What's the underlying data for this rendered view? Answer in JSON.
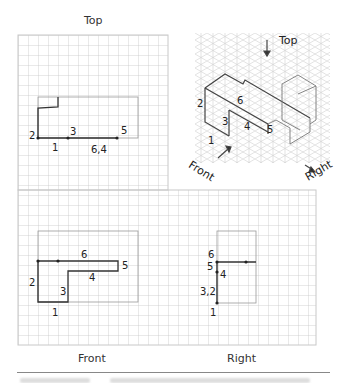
{
  "views": {
    "top": {
      "title": "Top",
      "labels": [
        "2",
        "3",
        "5",
        "1",
        "6,4"
      ]
    },
    "isometric": {
      "labels": [
        "Top",
        "6",
        "2",
        "3",
        "4",
        "5",
        "1",
        "Front",
        "Right"
      ]
    },
    "front": {
      "title": "Front",
      "labels": [
        "6",
        "5",
        "4",
        "2",
        "3",
        "1"
      ]
    },
    "right": {
      "title": "Right",
      "labels": [
        "6",
        "5",
        "4",
        "3,2",
        "1"
      ]
    }
  },
  "colors": {
    "grid": "#c8c8c8",
    "outline": "#999999",
    "stroke": "#333333"
  }
}
